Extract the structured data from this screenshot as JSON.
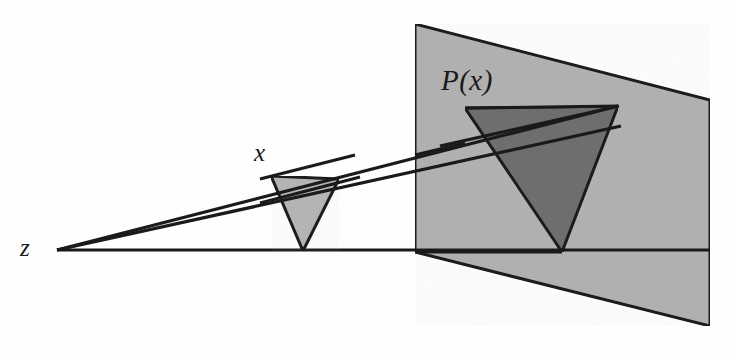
{
  "figure": {
    "background_color": "#fefefe",
    "stroke_color": "#1a1a1a",
    "labels": {
      "eye_point": "z",
      "source_triangle": "x",
      "projected_triangle": "P(x)"
    },
    "colors": {
      "plane_fill": "#b0b0b0",
      "source_triangle_fill": "#b4b4b4",
      "projected_triangle_fill": "#6e6e6e",
      "outline": "#1a1a1a"
    },
    "geometry": {
      "eye_point": {
        "x": 57,
        "y": 250
      },
      "image_plane": {
        "name": "image-plane-quad",
        "points": "415,24 710,100 710,326 415,252"
      },
      "source_triangle": {
        "name": "source-triangle",
        "points": "271,176 339,179 303,251"
      },
      "projected_triangle": {
        "name": "projected-triangle",
        "points": "465,108 618,106 562,252"
      },
      "rays": [
        {
          "name": "ray-baseline",
          "x1": 57,
          "y1": 250,
          "x2": 710,
          "y2": 250
        },
        {
          "name": "ray-upper",
          "x1": 57,
          "y1": 250,
          "x2": 618,
          "y2": 106
        },
        {
          "name": "ray-lower",
          "x1": 57,
          "y1": 250,
          "x2": 621,
          "y2": 126
        }
      ],
      "plane_base_edge": {
        "name": "plane-base-edge",
        "x1": 415,
        "y1": 252,
        "x2": 562,
        "y2": 252
      }
    },
    "label_positions": {
      "eye_point": {
        "x": 20,
        "y": 235
      },
      "source_triangle": {
        "x": 254,
        "y": 140
      },
      "projected_triangle": {
        "x": 441,
        "y": 66
      }
    }
  }
}
